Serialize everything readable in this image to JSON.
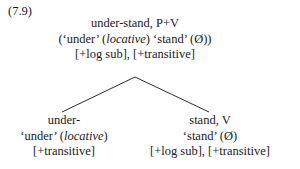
{
  "example": {
    "number": "(7.9)"
  },
  "tree": {
    "root": {
      "line1": "under-stand, P+V",
      "line2_pre": "(‘under’ (",
      "line2_italic": "locative",
      "line2_post": ") ‘stand’ (Ø))",
      "line3": "[+log sub], [+transitive]"
    },
    "left": {
      "line1": "under-",
      "line2_pre": "‘under’ (",
      "line2_italic": "locative",
      "line2_post": ")",
      "line3": "[+transitive]"
    },
    "right": {
      "line1": "stand, V",
      "line2_pre": "‘stand’ (Ø)",
      "line2_italic": "",
      "line2_post": "",
      "line3": "[+log sub], [+transitive]"
    }
  },
  "branches": {
    "apex_x": 135,
    "apex_y": 77,
    "left_end_x": 62,
    "left_end_y": 112,
    "right_end_x": 209,
    "right_end_y": 112,
    "color": "#2b2b2b"
  }
}
